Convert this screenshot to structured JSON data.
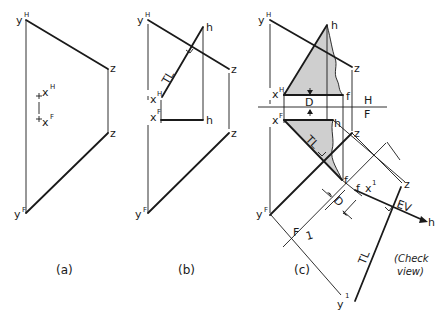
{
  "figure": {
    "panels": [
      {
        "id": "a",
        "caption": "(a)",
        "labels": {
          "yH": "y",
          "yH_sup": "H",
          "z_upper": "z",
          "xH": "x",
          "xH_sup": "H",
          "xF": "x",
          "xF_sup": "F",
          "z_lower": "z",
          "yF": "y",
          "yF_sup": "F"
        }
      },
      {
        "id": "b",
        "caption": "(b)",
        "labels": {
          "yH": "y",
          "yH_sup": "H",
          "h_upper": "h",
          "z_upper": "z",
          "tl": "TL",
          "xH": "x",
          "xH_sup": "H",
          "xF": "x",
          "xF_sup": "F",
          "h_lower": "h",
          "z_lower": "z",
          "yF": "y",
          "yF_sup": "F"
        }
      },
      {
        "id": "c",
        "caption": "(c)",
        "labels": {
          "yH": "y",
          "yH_sup": "H",
          "h_upper": "h",
          "z_upper": "z",
          "xH": "x",
          "xH_sup": "H",
          "f_upper": "f",
          "d_upper": "D",
          "fold_H": "H",
          "fold_F": "F",
          "xF": "x",
          "xF_sup": "F",
          "h_lower": "h",
          "tl_front": "TL",
          "z_lower": "z",
          "f_lower": "f",
          "yF": "y",
          "yF_sup": "F",
          "f_aux": "f",
          "x1": "x",
          "x1_sup": "1",
          "d_lower": "D",
          "z_aux": "z",
          "ev": "EV",
          "h_aux": "h",
          "fold_F2": "F",
          "fold_1": "1",
          "tl_aux": "TL",
          "y1": "y",
          "y1_sup": "1",
          "check_1": "(Check",
          "check_2": "view)"
        }
      }
    ]
  }
}
